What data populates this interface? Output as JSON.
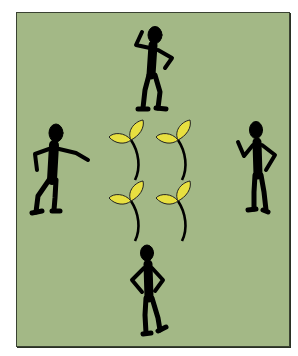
{
  "illustration": {
    "description": "Four stick figures standing around four sprouting seedlings",
    "background_color": "#a3b886",
    "figure_color": "#000000",
    "leaf_color": "#e8e040",
    "figures": [
      {
        "position": "top",
        "pose": "hand-on-head"
      },
      {
        "position": "left",
        "pose": "pointing"
      },
      {
        "position": "right",
        "pose": "gesturing"
      },
      {
        "position": "bottom",
        "pose": "hands-on-hips"
      }
    ],
    "seedlings": 4
  }
}
